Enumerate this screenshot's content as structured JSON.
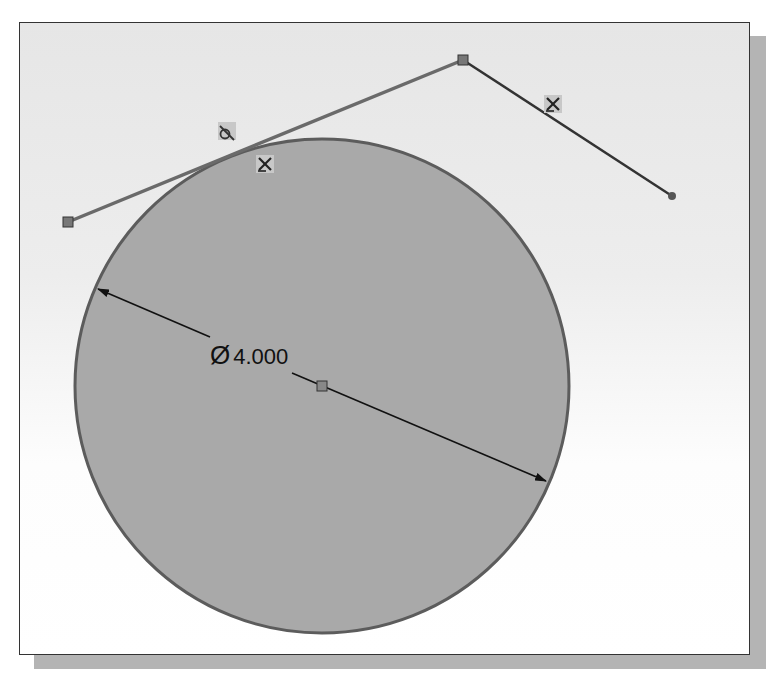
{
  "sketch": {
    "circle": {
      "cx": 322,
      "cy": 386,
      "r": 247,
      "fill": "#a9a9a9",
      "stroke": "#5c5c5c"
    },
    "center_point": {
      "x": 322,
      "y": 386
    },
    "lines": [
      {
        "x1": 68,
        "y1": 222,
        "x2": 463,
        "y2": 60,
        "stroke": "#666666",
        "relation": "tangent"
      },
      {
        "x1": 463,
        "y1": 60,
        "x2": 672,
        "y2": 196,
        "stroke": "#333333",
        "relation": "fix"
      }
    ],
    "endpoints": [
      {
        "x": 68,
        "y": 222,
        "shape": "square"
      },
      {
        "x": 463,
        "y": 60,
        "shape": "square"
      },
      {
        "x": 672,
        "y": 196,
        "shape": "dot"
      }
    ],
    "dimension": {
      "symbol": "Ø",
      "value": "4.000",
      "label": "Ø 4.000",
      "arrow_start": {
        "x": 98,
        "y": 289
      },
      "arrow_end": {
        "x": 546,
        "y": 481
      },
      "text_x": 210,
      "text_y": 364
    },
    "relation_icons": [
      {
        "name": "tangent-relation-icon",
        "glyph": "ტ",
        "x": 227,
        "y": 132
      },
      {
        "name": "fixed-relation-icon",
        "glyph": "✖",
        "x": 265,
        "y": 164
      },
      {
        "name": "fixed-relation-icon",
        "glyph": "✖",
        "x": 553,
        "y": 104
      }
    ]
  }
}
